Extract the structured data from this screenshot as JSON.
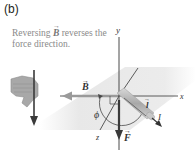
{
  "figure": {
    "panel_label": "(b)",
    "caption_parts": [
      "Reversing ",
      "B",
      " reverses the force direction."
    ]
  },
  "diagram": {
    "axes": {
      "x": "x",
      "y": "y",
      "z": "z"
    },
    "vectors": {
      "B": "B",
      "F": "F",
      "l": "l",
      "I": "I"
    },
    "angle": "ϕ",
    "colors": {
      "plane": "#e6e6e6",
      "axis": "#4a4a4a",
      "B_arrow": "#9a9a9a",
      "F_arrow": "#3a3a3a",
      "wire": "#b5b5b5",
      "hand": "#a8a8a8",
      "caption": "#8a8a8a"
    }
  }
}
